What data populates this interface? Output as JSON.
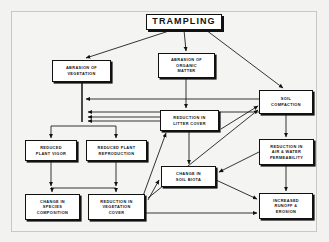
{
  "diagram": {
    "title": "TRAMPLING",
    "type": "flowchart",
    "background_color": "#f2f2f0",
    "frame_color": "#c8c8c4",
    "node_fill": "#ffffff",
    "node_stroke": "#111111",
    "nodes": [
      {
        "id": "trampling",
        "label": "TRAMPLING"
      },
      {
        "id": "abrasion-vegetation",
        "label": "ABRASION OF\nVEGETATION"
      },
      {
        "id": "abrasion-organic",
        "label": "ABRASION OF\nORGANIC\nMATTER"
      },
      {
        "id": "soil-compaction",
        "label": "SOIL\nCOMPACTION"
      },
      {
        "id": "reduction-litter",
        "label": "REDUCTION IN\nLITTER COVER"
      },
      {
        "id": "reduced-vigor",
        "label": "REDUCED\nPLANT VIGOR"
      },
      {
        "id": "reduced-reproduction",
        "label": "REDUCED PLANT\nREPRODUCTION"
      },
      {
        "id": "reduction-permeability",
        "label": "REDUCTION IN\nAIR & WATER\nPERMEABILITY"
      },
      {
        "id": "change-soil-biota",
        "label": "CHANGE IN\nSOIL BIOTA"
      },
      {
        "id": "change-species",
        "label": "CHANGE IN\nSPECIES\nCOMPOSITION"
      },
      {
        "id": "reduction-vegetation",
        "label": "REDUCTION IN\nVEGETATION\nCOVER"
      },
      {
        "id": "increased-runoff",
        "label": "INCREASED\nRUNOFF &\nEROSION"
      }
    ],
    "edges": [
      {
        "from": "trampling",
        "to": "abrasion-vegetation"
      },
      {
        "from": "trampling",
        "to": "abrasion-organic"
      },
      {
        "from": "trampling",
        "to": "soil-compaction"
      },
      {
        "from": "abrasion-organic",
        "to": "reduction-litter"
      },
      {
        "from": "abrasion-vegetation",
        "to": "plant-bus"
      },
      {
        "from": "soil-compaction",
        "to": "abrasion-vegetation-bus"
      },
      {
        "from": "soil-compaction",
        "to": "reduction-permeability"
      },
      {
        "from": "reduction-litter",
        "to": "plant-bus"
      },
      {
        "from": "reduction-litter",
        "to": "change-soil-biota"
      },
      {
        "from": "reduction-litter",
        "to": "soil-compaction"
      },
      {
        "from": "reduction-permeability",
        "to": "plant-bus"
      },
      {
        "from": "reduction-permeability",
        "to": "change-soil-biota"
      },
      {
        "from": "reduction-permeability",
        "to": "increased-runoff"
      },
      {
        "from": "reduced-vigor",
        "to": "bottom-bus"
      },
      {
        "from": "reduced-reproduction",
        "to": "bottom-bus"
      },
      {
        "from": "bottom-bus",
        "to": "change-species"
      },
      {
        "from": "bottom-bus",
        "to": "reduction-vegetation"
      },
      {
        "from": "reduction-vegetation",
        "to": "change-soil-biota"
      },
      {
        "from": "reduction-vegetation",
        "to": "reduction-litter"
      },
      {
        "from": "reduction-vegetation",
        "to": "soil-compaction"
      },
      {
        "from": "reduction-vegetation",
        "to": "increased-runoff"
      },
      {
        "from": "change-soil-biota",
        "to": "plant-bus"
      },
      {
        "from": "change-soil-biota",
        "to": "increased-runoff"
      }
    ]
  }
}
